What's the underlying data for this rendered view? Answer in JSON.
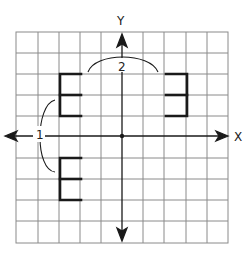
{
  "diagram": {
    "type": "coordinate-grid-reflection",
    "grid": {
      "columns": 10,
      "rows": 10,
      "line_color": "#8a8a8a"
    },
    "axes": {
      "x_label": "X",
      "y_label": "Y",
      "color": "#1a1a1a"
    },
    "annotations": [
      {
        "id": "1",
        "label": "1",
        "meaning": "reflection across X-axis"
      },
      {
        "id": "2",
        "label": "2",
        "meaning": "reflection across Y-axis"
      }
    ],
    "shapes": [
      {
        "name": "original-E",
        "quadrant": "II",
        "orientation": "normal"
      },
      {
        "name": "reflected-E-y-axis",
        "quadrant": "I",
        "orientation": "mirrored horizontally"
      },
      {
        "name": "reflected-E-x-axis",
        "quadrant": "III",
        "orientation": "normal"
      }
    ],
    "shape_color": "#1a1a1a"
  }
}
